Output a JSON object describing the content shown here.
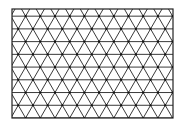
{
  "figure": {
    "background_color": "#ffffff",
    "line_color": "#222222",
    "vertex_color": "#111111",
    "frame": {
      "x": 12,
      "y": 9,
      "width": 161,
      "height": 109
    },
    "lattice": {
      "side": 14.7,
      "row_height": 12.73,
      "origin_x": 25.6,
      "origin_y": 118,
      "rows_above": 9,
      "rows_below": 1
    }
  }
}
